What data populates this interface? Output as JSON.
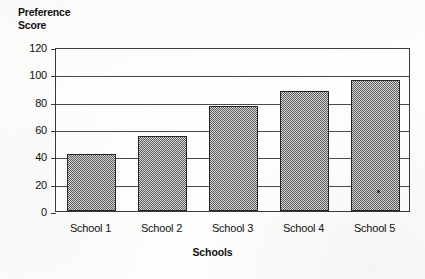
{
  "chart_data": {
    "type": "bar",
    "title": "",
    "subtitle": "",
    "xlabel": "Schools",
    "ylabel": "Preference\nScore",
    "categories": [
      "School 1",
      "School 2",
      "School 3",
      "School 4",
      "School 5"
    ],
    "values": [
      42,
      55,
      77,
      88,
      96
    ],
    "ylim": [
      0,
      120
    ],
    "yticks": [
      0,
      20,
      40,
      60,
      80,
      100,
      120
    ],
    "ytick_labels": [
      "0",
      "20",
      "40",
      "60",
      "80",
      "100",
      "120"
    ],
    "grid": "horizontal",
    "legend": "none",
    "series": [
      {
        "name": "Preference Score",
        "values": [
          42,
          55,
          77,
          88,
          96
        ],
        "fill": "gray-checkerboard-hatch",
        "fill_color": "#8f8f8f",
        "edge_color": "#242424"
      }
    ],
    "annotations": [],
    "colors": {
      "background": "#fdfdfc",
      "plot_background": "#fefefe",
      "frame": "#3a3a3a",
      "gridline": "#4a4a4a",
      "text": "#111111"
    }
  },
  "axes": {
    "y_title": "Preference\nScore",
    "x_title": "Schools"
  }
}
